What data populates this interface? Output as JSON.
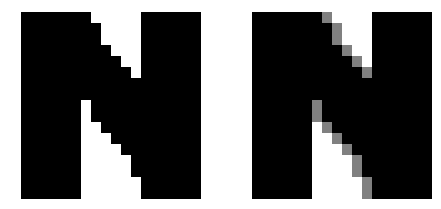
{
  "image": {
    "width": 441,
    "height": 209,
    "background_color": "#ffffff",
    "subject": "Two large pixelated capital letter N glyphs side by side",
    "purpose_caption": "aliasing versus anti-aliasing comparison"
  },
  "palette": {
    "ink": "#000000",
    "paper": "#ffffff",
    "antialias_gray": "#808080",
    "antialias_gray_light": "#a8a8a8",
    "antialias_gray_dark": "#585858"
  },
  "pixel_grid": {
    "cell_width": 10,
    "cell_height": 11,
    "note": "Glyphs are an upscaled low-resolution bitmap; each visible block is one source pixel"
  },
  "panels": [
    {
      "id": "aliased",
      "name": "left-glyph-aliased",
      "letter": "N",
      "rendering": "aliased",
      "description": "Hard-edged stair-stepped diagonal, pure black and white only, no intermediate tones",
      "bbox": {
        "x": 21,
        "y": 12,
        "width": 181,
        "height": 183
      },
      "stem_left": {
        "x": 21,
        "y": 12,
        "width": 60,
        "height": 183
      },
      "stem_right": {
        "x": 142,
        "y": 12,
        "width": 60,
        "height": 183
      },
      "uses_gray": false
    },
    {
      "id": "antialiased",
      "name": "right-glyph-antialiased",
      "letter": "N",
      "rendering": "anti-aliased",
      "description": "Same stair-stepped diagonal softened with medium gray partial-coverage pixels on both edges of the diagonal stroke",
      "bbox": {
        "x": 252,
        "y": 12,
        "width": 180,
        "height": 183
      },
      "stem_left": {
        "x": 252,
        "y": 12,
        "width": 60,
        "height": 183
      },
      "stem_right": {
        "x": 372,
        "y": 12,
        "width": 60,
        "height": 183
      },
      "uses_gray": true
    }
  ],
  "geometry": {
    "comment": "Diagonal stroke descends left-to-right; coordinates are panel-local (origin at glyph bbox left/top). Steps are emitted as blocks on the pixel grid.",
    "stem_width_cells": 6,
    "glyph_width_cells": 18,
    "glyph_height_cells": 17,
    "diagonal_steps": [
      {
        "row": 0,
        "left_cell": 6,
        "right_cell": 6
      },
      {
        "row": 1,
        "left_cell": 6,
        "right_cell": 7
      },
      {
        "row": 2,
        "left_cell": 6,
        "right_cell": 7
      },
      {
        "row": 3,
        "left_cell": 6,
        "right_cell": 8
      },
      {
        "row": 4,
        "left_cell": 6,
        "right_cell": 9
      },
      {
        "row": 5,
        "left_cell": 6,
        "right_cell": 10
      },
      {
        "row": 6,
        "left_cell": 6,
        "right_cell": 11
      },
      {
        "row": 7,
        "left_cell": 6,
        "right_cell": 12
      },
      {
        "row": 8,
        "left_cell": 7,
        "right_cell": 12
      },
      {
        "row": 9,
        "left_cell": 7,
        "right_cell": 12
      },
      {
        "row": 10,
        "left_cell": 8,
        "right_cell": 12
      },
      {
        "row": 11,
        "left_cell": 9,
        "right_cell": 12
      },
      {
        "row": 12,
        "left_cell": 10,
        "right_cell": 12
      },
      {
        "row": 13,
        "left_cell": 11,
        "right_cell": 12
      },
      {
        "row": 14,
        "left_cell": 11,
        "right_cell": 12
      },
      {
        "row": 15,
        "left_cell": 12,
        "right_cell": 12
      },
      {
        "row": 16,
        "left_cell": 12,
        "right_cell": 12
      }
    ]
  }
}
